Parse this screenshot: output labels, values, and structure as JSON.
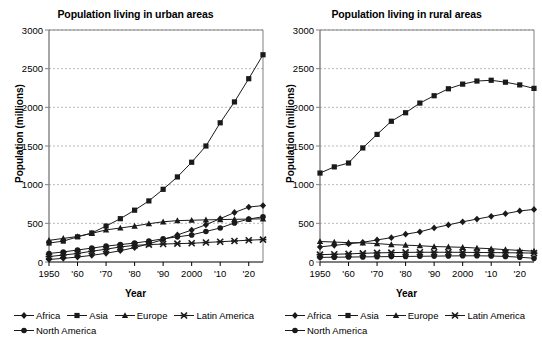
{
  "axis": {
    "ylabel": "Population (millions)",
    "xlabel": "Year",
    "yticks": [
      "0",
      "500",
      "1000",
      "1500",
      "2000",
      "2500",
      "3000"
    ],
    "xticks": [
      "1950",
      "'60",
      "'70",
      "'80",
      "'90",
      "2000",
      "'10",
      "'20"
    ],
    "ylim": [
      0,
      3000
    ],
    "xlim": [
      1950,
      2025
    ]
  },
  "legend": {
    "items": [
      {
        "label": "Africa",
        "marker": "diamond"
      },
      {
        "label": "Asia",
        "marker": "square"
      },
      {
        "label": "Europe",
        "marker": "triangle"
      },
      {
        "label": "Latin America",
        "marker": "cross-x"
      },
      {
        "label": "North America",
        "marker": "circle"
      }
    ]
  },
  "colors": {
    "line": "#1a1a1a",
    "grid": "#b9b9b9",
    "axis": "#808080",
    "background": "#ffffff"
  },
  "chart_data": [
    {
      "type": "line",
      "title": "Population living in urban areas",
      "xlabel": "Year",
      "ylabel": "Population (millions)",
      "xlim": [
        1950,
        2025
      ],
      "ylim": [
        0,
        3000
      ],
      "grid": "horizontal",
      "legend_position": "bottom",
      "x": [
        1950,
        1955,
        1960,
        1965,
        1970,
        1975,
        1980,
        1985,
        1990,
        1995,
        2000,
        2005,
        2010,
        2015,
        2020,
        2025
      ],
      "series": [
        {
          "name": "Africa",
          "marker": "diamond",
          "values": [
            33,
            47,
            64,
            86,
            113,
            146,
            186,
            235,
            290,
            350,
            413,
            482,
            560,
            640,
            710,
            730
          ]
        },
        {
          "name": "Asia",
          "marker": "square",
          "values": [
            245,
            270,
            325,
            375,
            465,
            560,
            670,
            790,
            940,
            1100,
            1290,
            1500,
            1800,
            2070,
            2370,
            2680
          ]
        },
        {
          "name": "Europe",
          "marker": "triangle",
          "values": [
            280,
            305,
            330,
            370,
            415,
            440,
            465,
            495,
            520,
            535,
            540,
            545,
            548,
            552,
            555,
            558
          ]
        },
        {
          "name": "Latin America",
          "marker": "cross-x",
          "values": [
            70,
            90,
            110,
            140,
            165,
            195,
            215,
            225,
            232,
            238,
            242,
            252,
            262,
            272,
            282,
            290
          ]
        },
        {
          "name": "North America",
          "marker": "circle",
          "values": [
            110,
            130,
            155,
            180,
            205,
            225,
            245,
            270,
            300,
            325,
            350,
            395,
            440,
            505,
            555,
            585
          ]
        }
      ]
    },
    {
      "type": "line",
      "title": "Population living in rural areas",
      "xlabel": "Year",
      "ylabel": "Population (millions)",
      "xlim": [
        1950,
        2025
      ],
      "ylim": [
        0,
        3000
      ],
      "grid": "horizontal",
      "legend_position": "bottom",
      "x": [
        1950,
        1955,
        1960,
        1965,
        1970,
        1975,
        1980,
        1985,
        1990,
        1995,
        2000,
        2005,
        2010,
        2015,
        2020,
        2025
      ],
      "series": [
        {
          "name": "Africa",
          "marker": "diamond",
          "values": [
            195,
            215,
            235,
            255,
            285,
            315,
            360,
            390,
            440,
            480,
            520,
            555,
            590,
            625,
            660,
            680
          ]
        },
        {
          "name": "Asia",
          "marker": "square",
          "values": [
            1150,
            1230,
            1280,
            1475,
            1650,
            1820,
            1930,
            2055,
            2150,
            2240,
            2300,
            2340,
            2350,
            2325,
            2290,
            2245
          ]
        },
        {
          "name": "Europe",
          "marker": "triangle",
          "values": [
            265,
            258,
            250,
            248,
            238,
            225,
            218,
            210,
            200,
            195,
            190,
            180,
            172,
            160,
            150,
            140
          ]
        },
        {
          "name": "Latin America",
          "marker": "cross-x",
          "values": [
            95,
            100,
            105,
            112,
            118,
            122,
            124,
            126,
            126,
            126,
            125,
            123,
            122,
            120,
            118,
            115
          ]
        },
        {
          "name": "North America",
          "marker": "circle",
          "values": [
            60,
            62,
            64,
            66,
            68,
            70,
            72,
            74,
            76,
            78,
            80,
            80,
            78,
            72,
            62,
            48
          ]
        }
      ]
    }
  ]
}
